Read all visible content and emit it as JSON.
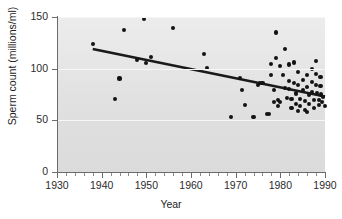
{
  "chart_data": {
    "type": "scatter",
    "title": "",
    "xlabel": "Year",
    "ylabel": "Sperm count (millions/ml)",
    "xlim": [
      1930,
      1990
    ],
    "ylim": [
      0,
      150
    ],
    "grid": true,
    "grid_axis": "y",
    "legend": "none",
    "xticks": [
      1930,
      1940,
      1950,
      1960,
      1970,
      1980,
      1990
    ],
    "xtick_labels": [
      "1930",
      "1940",
      "1950",
      "1960",
      "1970",
      "1980",
      "1990"
    ],
    "xtick_minor_interval": 2,
    "yticks": [
      0,
      50,
      100,
      150
    ],
    "ytick_labels": [
      "0",
      "50",
      "100",
      "150"
    ],
    "marker_color": "#131313",
    "trend_color": "#1a1a1a",
    "panel_color": "#e6e6e7",
    "gridline_color": "#f7f7f7",
    "points": [
      [
        1938.0,
        124.0
      ],
      [
        1943.0,
        70.5
      ],
      [
        1944.0,
        90.5
      ],
      [
        1945.0,
        137.0
      ],
      [
        1948.0,
        108.0
      ],
      [
        1949.5,
        148.5
      ],
      [
        1950.0,
        105.5
      ],
      [
        1951.0,
        111.0
      ],
      [
        1956.0,
        139.0
      ],
      [
        1963.0,
        114.0
      ],
      [
        1963.5,
        101.0
      ],
      [
        1969.0,
        53.5
      ],
      [
        1971.0,
        91.0
      ],
      [
        1971.5,
        79.5
      ],
      [
        1972.0,
        65.0
      ],
      [
        1974.0,
        53.0
      ],
      [
        1975.0,
        84.5
      ],
      [
        1976.0,
        86.0
      ],
      [
        1977.0,
        56.5
      ],
      [
        1977.5,
        56.0
      ],
      [
        1978.0,
        104.5
      ],
      [
        1978.0,
        94.0
      ],
      [
        1978.5,
        79.0
      ],
      [
        1978.5,
        68.0
      ],
      [
        1979.0,
        135.0
      ],
      [
        1979.0,
        110.0
      ],
      [
        1979.5,
        70.0
      ],
      [
        1979.5,
        64.0
      ],
      [
        1980.0,
        103.0
      ],
      [
        1980.5,
        93.5
      ],
      [
        1981.0,
        119.0
      ],
      [
        1981.0,
        81.0
      ],
      [
        1981.5,
        72.0
      ],
      [
        1982.0,
        104.0
      ],
      [
        1982.0,
        88.0
      ],
      [
        1982.0,
        80.5
      ],
      [
        1982.5,
        70.5
      ],
      [
        1982.5,
        62.0
      ],
      [
        1983.0,
        106.0
      ],
      [
        1983.0,
        86.5
      ],
      [
        1983.5,
        76.0
      ],
      [
        1983.5,
        66.0
      ],
      [
        1984.0,
        97.0
      ],
      [
        1984.0,
        84.0
      ],
      [
        1984.5,
        71.0
      ],
      [
        1984.5,
        63.5
      ],
      [
        1985.0,
        89.0
      ],
      [
        1985.0,
        79.5
      ],
      [
        1985.5,
        68.5
      ],
      [
        1985.5,
        60.0
      ],
      [
        1986.0,
        94.0
      ],
      [
        1986.0,
        82.0
      ],
      [
        1986.5,
        74.5
      ],
      [
        1986.5,
        65.5
      ],
      [
        1987.0,
        100.0
      ],
      [
        1987.0,
        87.5
      ],
      [
        1987.0,
        77.0
      ],
      [
        1987.5,
        69.5
      ],
      [
        1987.5,
        61.5
      ],
      [
        1988.0,
        107.0
      ],
      [
        1988.0,
        95.0
      ],
      [
        1988.0,
        84.5
      ],
      [
        1988.3,
        76.5
      ],
      [
        1988.6,
        70.0
      ],
      [
        1988.6,
        64.5
      ],
      [
        1989.0,
        92.0
      ],
      [
        1989.0,
        83.0
      ],
      [
        1989.2,
        75.0
      ],
      [
        1989.4,
        68.0
      ],
      [
        1989.6,
        72.5
      ],
      [
        1990.0,
        63.5
      ],
      [
        1975.5,
        86.0
      ],
      [
        1980.0,
        67.5
      ],
      [
        1986.0,
        58.5
      ],
      [
        1984.0,
        59.0
      ]
    ],
    "trendline": {
      "x_start": 1938.0,
      "y_start": 119.0,
      "x_end": 1990.0,
      "y_end": 73.0,
      "width_px": 2.6
    }
  }
}
